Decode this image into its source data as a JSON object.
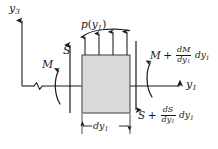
{
  "figure": {
    "type": "free-body-diagram",
    "background_color": "#ffffff",
    "line_color": "#1a1a1a",
    "element_fill_color": "#d9d9d9",
    "element_stroke_color": "#4d4d4d"
  },
  "axes": {
    "vertical": {
      "label_base": "y",
      "label_sub": "3",
      "label_full": "y3",
      "direction": "up"
    },
    "horizontal": {
      "label_base": "y",
      "label_sub": "1",
      "label_full": "y1",
      "direction": "right",
      "has_break_symbol": true
    }
  },
  "distributed_load": {
    "label_base": "p",
    "label_open": "(",
    "label_arg": "y",
    "label_arg_sub": "1",
    "label_close": ")",
    "label_full": "p(y1)",
    "arrow_count": 4,
    "direction": "up"
  },
  "left_face": {
    "moment": {
      "label": "M",
      "sense": "counterclockwise"
    },
    "shear": {
      "label": "S",
      "direction": "up"
    }
  },
  "right_face": {
    "moment": {
      "term": "M",
      "operator": "+",
      "numerator_d": "d",
      "numerator_var": "M",
      "denominator_d": "d",
      "denominator_var": "y",
      "denominator_sub": "1",
      "tail_d": "d",
      "tail_var": "y",
      "tail_sub": "1",
      "label_full": "M + dM/dy1 dy1",
      "sense": "counterclockwise"
    },
    "shear": {
      "term": "S",
      "operator": "+",
      "numerator_d": "d",
      "numerator_var": "S",
      "denominator_d": "d",
      "denominator_var": "y",
      "denominator_sub": "1",
      "tail_d": "d",
      "tail_var": "y",
      "tail_sub": "1",
      "label_full": "S + dS/dy1 dy1",
      "direction": "down"
    }
  },
  "dimension": {
    "label_d": "d",
    "label_var": "y",
    "label_sub": "1",
    "label_full": "dy1"
  }
}
